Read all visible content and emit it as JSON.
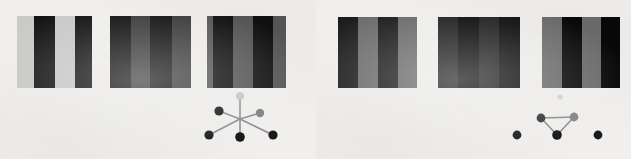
{
  "figure": {
    "width": 631,
    "height": 159,
    "background": "#ffffff",
    "panel_background": "#f0efed"
  },
  "panels": [
    {
      "id": "left",
      "name": "left-panel",
      "x": 0,
      "y": 0,
      "width": 316,
      "height": 159,
      "background": "#f0efed",
      "patches": [
        {
          "name": "grating-patch-1",
          "x": 17,
          "y": 16,
          "width": 75,
          "height": 72,
          "light_color": "#c9c9c7",
          "dark_color": "#121212",
          "bars": [
            {
              "x": 0,
              "width": 17,
              "color": "#c9c9c7"
            },
            {
              "x": 17,
              "width": 21,
              "color": "#121212"
            },
            {
              "x": 38,
              "width": 20,
              "color": "#c9c9c7"
            },
            {
              "x": 58,
              "width": 19,
              "color": "#121212"
            }
          ]
        },
        {
          "name": "grating-patch-2",
          "x": 110,
          "y": 16,
          "width": 81,
          "height": 72,
          "light_color": "#3a3a3a",
          "dark_color": "#111111",
          "bars": [
            {
              "x": 0,
              "width": 21,
              "color": "#111111"
            },
            {
              "x": 21,
              "width": 19,
              "color": "#3a3a3a"
            },
            {
              "x": 40,
              "width": 22,
              "color": "#111111"
            },
            {
              "x": 62,
              "width": 20,
              "color": "#3a3a3a"
            }
          ]
        },
        {
          "name": "grating-patch-3",
          "x": 207,
          "y": 16,
          "width": 79,
          "height": 72,
          "light_color": "#565656",
          "dark_color": "#101010",
          "bars": [
            {
              "x": 0,
              "width": 6,
              "color": "#565656"
            },
            {
              "x": 6,
              "width": 20,
              "color": "#101010"
            },
            {
              "x": 26,
              "width": 20,
              "color": "#565656"
            },
            {
              "x": 46,
              "width": 20,
              "color": "#101010"
            },
            {
              "x": 66,
              "width": 14,
              "color": "#565656"
            }
          ]
        }
      ],
      "diagram": {
        "name": "star-node-link-diagram",
        "type": "radial-star",
        "x": 203,
        "y": 92,
        "width": 82,
        "height": 50,
        "hub": {
          "x": 37,
          "y": 27
        },
        "edge_color": "#8c8c8c",
        "edge_width": 1.6,
        "nodes": [
          {
            "id": "top",
            "x": 37,
            "y": 4,
            "r": 4.0,
            "color": "#c6c6c6"
          },
          {
            "id": "upper-left",
            "x": 16,
            "y": 19,
            "r": 4.6,
            "color": "#1a1a1a"
          },
          {
            "id": "upper-right",
            "x": 57,
            "y": 21,
            "r": 4.2,
            "color": "#7f7f7f"
          },
          {
            "id": "lower-left",
            "x": 6,
            "y": 43,
            "r": 4.6,
            "color": "#1a1a1a"
          },
          {
            "id": "bottom",
            "x": 37,
            "y": 45,
            "r": 4.8,
            "color": "#141414"
          },
          {
            "id": "lower-right",
            "x": 70,
            "y": 43,
            "r": 4.6,
            "color": "#1a1a1a"
          }
        ],
        "edges": [
          {
            "from": "hub",
            "to": "top"
          },
          {
            "from": "hub",
            "to": "upper-left"
          },
          {
            "from": "hub",
            "to": "upper-right"
          },
          {
            "from": "hub",
            "to": "lower-left"
          },
          {
            "from": "hub",
            "to": "bottom"
          },
          {
            "from": "hub",
            "to": "lower-right"
          }
        ]
      }
    },
    {
      "id": "right",
      "name": "right-panel",
      "x": 316,
      "y": 0,
      "width": 315,
      "height": 159,
      "background": "#f0efed",
      "patches": [
        {
          "name": "grating-patch-4",
          "x": 22,
          "y": 17,
          "width": 79,
          "height": 71,
          "light_color": "#6b6b6b",
          "dark_color": "#1c1c1c",
          "bars": [
            {
              "x": 0,
              "width": 20,
              "color": "#1c1c1c"
            },
            {
              "x": 20,
              "width": 20,
              "color": "#6b6b6b"
            },
            {
              "x": 40,
              "width": 20,
              "color": "#1c1c1c"
            },
            {
              "x": 60,
              "width": 20,
              "color": "#6b6b6b"
            }
          ]
        },
        {
          "name": "grating-patch-5",
          "x": 122,
          "y": 17,
          "width": 82,
          "height": 71,
          "light_color": "#1e1e1e",
          "dark_color": "#0a0a0a",
          "bars": [
            {
              "x": 0,
              "width": 20,
              "color": "#1e1e1e"
            },
            {
              "x": 20,
              "width": 21,
              "color": "#0a0a0a"
            },
            {
              "x": 41,
              "width": 20,
              "color": "#1e1e1e"
            },
            {
              "x": 61,
              "width": 22,
              "color": "#0a0a0a"
            }
          ]
        },
        {
          "name": "grating-patch-6",
          "x": 226,
          "y": 17,
          "width": 78,
          "height": 71,
          "light_color": "#6b6b6b",
          "dark_color": "#080808",
          "bars": [
            {
              "x": 0,
              "width": 20,
              "color": "#6b6b6b"
            },
            {
              "x": 20,
              "width": 20,
              "color": "#080808"
            },
            {
              "x": 40,
              "width": 19,
              "color": "#6b6b6b"
            },
            {
              "x": 59,
              "width": 20,
              "color": "#080808"
            }
          ]
        }
      ],
      "diagram": {
        "name": "triangle-node-link-diagram",
        "type": "triangle",
        "x": 196,
        "y": 90,
        "width": 96,
        "height": 52,
        "edge_color": "#8c8c8c",
        "edge_width": 1.6,
        "nodes": [
          {
            "id": "faint-top",
            "x": 48,
            "y": 7,
            "r": 2.6,
            "color": "#d0d0d0"
          },
          {
            "id": "tri-left",
            "x": 29,
            "y": 28,
            "r": 4.4,
            "color": "#333333"
          },
          {
            "id": "tri-right",
            "x": 62,
            "y": 27,
            "r": 4.4,
            "color": "#858585"
          },
          {
            "id": "tri-bottom",
            "x": 45,
            "y": 45,
            "r": 4.8,
            "color": "#161616"
          },
          {
            "id": "iso-left",
            "x": 5,
            "y": 45,
            "r": 4.4,
            "color": "#1a1a1a"
          },
          {
            "id": "iso-right",
            "x": 86,
            "y": 45,
            "r": 4.4,
            "color": "#1a1a1a"
          }
        ],
        "edges": [
          {
            "from": "tri-left",
            "to": "tri-right"
          },
          {
            "from": "tri-left",
            "to": "tri-bottom"
          },
          {
            "from": "tri-right",
            "to": "tri-bottom"
          }
        ]
      }
    }
  ]
}
